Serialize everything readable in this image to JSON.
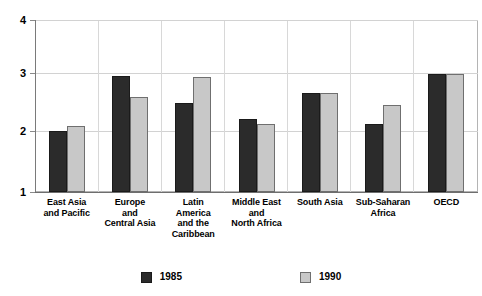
{
  "chart_data": {
    "type": "bar",
    "title": "",
    "xlabel": "",
    "ylabel": "",
    "ylim": [
      1,
      4
    ],
    "yticks": [
      1,
      2,
      3,
      4
    ],
    "ytick_labels": [
      "1",
      "2",
      "3",
      "4"
    ],
    "grid": true,
    "legend_position": "bottom",
    "categories": [
      "East Asia\nand Pacific",
      "Europe\nand\nCentral Asia",
      "Latin\nAmerica\nand the\nCaribbean",
      "Middle East\nand\nNorth Africa",
      "South Asia",
      "Sub-Saharan\nAfrica",
      "OECD"
    ],
    "series": [
      {
        "name": "1985",
        "color": "#2b2b2b",
        "values": [
          2.07,
          3.03,
          2.55,
          2.28,
          2.73,
          2.18,
          3.06
        ]
      },
      {
        "name": "1990",
        "color": "#c8c8c8",
        "values": [
          2.15,
          2.65,
          3.0,
          2.19,
          2.73,
          2.52,
          3.06
        ]
      }
    ]
  },
  "axis": {
    "y_tick_labels": [
      "4",
      "3",
      "2",
      "1"
    ]
  },
  "categories_display": [
    [
      "East Asia",
      "and Pacific"
    ],
    [
      "Europe",
      "and",
      "Central Asia"
    ],
    [
      "Latin",
      "America",
      "and the",
      "Caribbean"
    ],
    [
      "Middle East",
      "and",
      "North Africa"
    ],
    [
      "South Asia"
    ],
    [
      "Sub-Saharan",
      "Africa"
    ],
    [
      "OECD"
    ]
  ],
  "legend": {
    "items": [
      {
        "label": "1985",
        "swatch": "dark-square-swatch"
      },
      {
        "label": "1990",
        "swatch": "light-square-swatch"
      }
    ]
  },
  "artifact": {
    "top_clipped_text": " "
  }
}
